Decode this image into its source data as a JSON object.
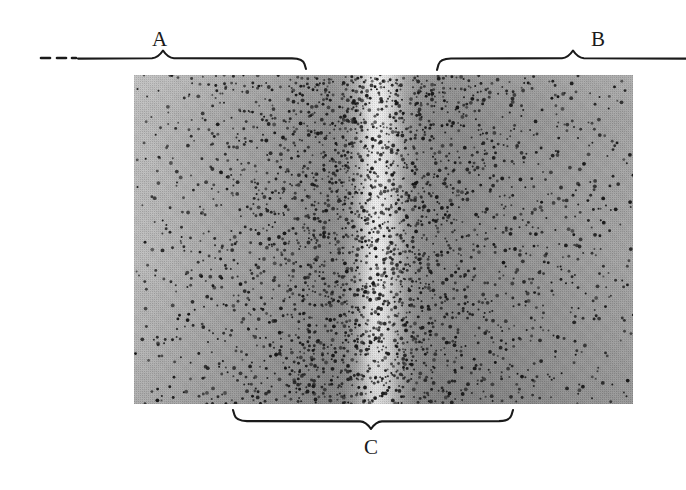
{
  "figure": {
    "caption_labels": {
      "region_a": "A",
      "region_b": "B",
      "region_c": "C"
    },
    "annotation_names": {
      "brace_a": "brace-region-a",
      "brace_b": "brace-region-b",
      "brace_c": "brace-region-c"
    },
    "colors": {
      "ink": "#1a1a1a",
      "panel_light": "#efefef",
      "panel_mid": "#a4a4a4",
      "panel_dark": "#878787",
      "background": "#ffffff"
    },
    "panel": {
      "left": 134,
      "top": 75,
      "width": 499,
      "height": 329,
      "description": "grayscale textured band with a bright vertical stripe near the center"
    }
  },
  "chart_data": {
    "type": "heatmap",
    "title": "",
    "subtitle": "",
    "xlabel": "",
    "ylabel": "",
    "grid": false,
    "legend_position": "none",
    "annotations": [
      {
        "label": "A",
        "type": "brace",
        "orientation": "up",
        "x_start": 41,
        "x_end": 308,
        "x_peak": 163,
        "y": 58,
        "dashed_lead_in": true
      },
      {
        "label": "B",
        "type": "brace",
        "orientation": "up",
        "x_start": 437,
        "x_end": 686,
        "x_peak": 573,
        "y": 58,
        "dashed_lead_in": false
      },
      {
        "label": "C",
        "type": "brace",
        "orientation": "down",
        "x_start": 233,
        "x_end": 513,
        "x_peak": 371,
        "y": 411,
        "dashed_lead_in": false
      }
    ],
    "x": [
      0,
      10,
      20,
      30,
      40,
      44,
      46,
      47,
      48,
      49,
      50,
      51,
      52,
      54,
      56,
      60,
      70,
      80,
      90,
      100
    ],
    "series": [
      {
        "name": "mean gray level (0 dark - 255 bright)",
        "values": [
          189,
          178,
          164,
          148,
          140,
          150,
          186,
          214,
          232,
          239,
          238,
          228,
          200,
          158,
          137,
          135,
          138,
          145,
          153,
          164
        ]
      },
      {
        "name": "dot density (marks per unit area, relative)",
        "values": [
          0.12,
          0.2,
          0.34,
          0.55,
          0.8,
          0.92,
          0.97,
          1.0,
          0.98,
          0.95,
          0.94,
          0.96,
          0.98,
          0.9,
          0.78,
          0.6,
          0.4,
          0.28,
          0.2,
          0.14
        ]
      }
    ],
    "xlim": [
      0,
      100
    ],
    "ylim": [
      0,
      255
    ]
  }
}
